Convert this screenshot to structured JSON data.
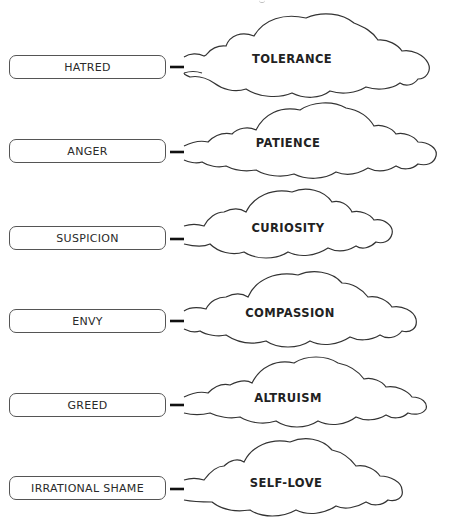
{
  "diagram": {
    "type": "transformation-mapping",
    "colors": {
      "stroke": "#333333",
      "text": "#222222",
      "background": "#ffffff"
    },
    "rows": [
      {
        "from": "HATRED",
        "to": "TOLERANCE"
      },
      {
        "from": "ANGER",
        "to": "PATIENCE"
      },
      {
        "from": "SUSPICION",
        "to": "CURIOSITY"
      },
      {
        "from": "ENVY",
        "to": "COMPASSION"
      },
      {
        "from": "GREED",
        "to": "ALTRUISM"
      },
      {
        "from": "IRRATIONAL SHAME",
        "to": "SELF-LOVE"
      }
    ]
  }
}
